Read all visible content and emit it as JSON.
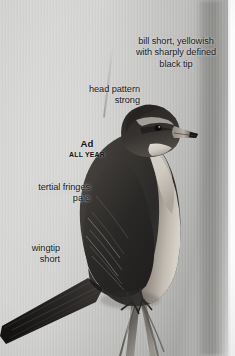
{
  "plate": {
    "width": 235,
    "height": 356,
    "subject": "warbler perched on reed stem",
    "photo_style": "black-and-white field guide photograph"
  },
  "annotations": [
    {
      "id": "bill",
      "name": "annotation-bill",
      "text": "bill short, yellowish\nwith sharply defined\nblack tip",
      "align": "center"
    },
    {
      "id": "head",
      "name": "annotation-head-pattern",
      "text": "head pattern\nstrong",
      "align": "right"
    },
    {
      "id": "tertial",
      "name": "annotation-tertial-fringes",
      "text": "tertial fringes\npale",
      "align": "right"
    },
    {
      "id": "wingtip",
      "name": "annotation-wingtip",
      "text": "wingtip\nshort",
      "align": "right"
    }
  ],
  "age_label": {
    "age": "Ad",
    "season": "ALL YEAR"
  },
  "colors": {
    "text": "#18181a",
    "background_light": "#d6d7d4",
    "background_mid": "#b4b5b2",
    "background_dark": "#a9aaa7",
    "edge_white": "#ffffff",
    "bird_dark": "#2e2c2a",
    "bird_mid": "#4d4a46",
    "bird_pale": "#cdc8c0",
    "bird_throat": "#efeeea",
    "bill_pale": "#b9b4ac",
    "bill_tip": "#1d1c1b"
  }
}
